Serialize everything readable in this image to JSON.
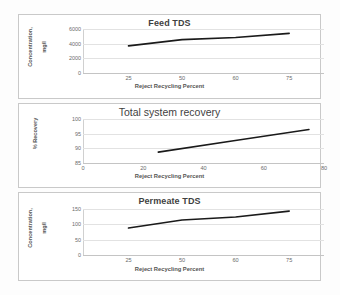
{
  "figure": {
    "background": "#fdfdfd",
    "panel_border_color": "#c9c9c9",
    "line_color": "#1a1a1a",
    "gridline_color": "#e2e2e2",
    "tick_text_color": "#6b6b6b",
    "title_text_color": "#3f3f3f"
  },
  "chart_data": [
    {
      "type": "line",
      "title": "Feed TDS",
      "xlabel": "Reject Recycling Percent",
      "ylabel": "Concentration,\nmg/l",
      "ylabel_line1": "Concentration,",
      "ylabel_line2": "mg/l",
      "x": [
        25,
        50,
        60,
        75
      ],
      "values": [
        3700,
        4550,
        4850,
        5400
      ],
      "xticks": [
        25,
        50,
        60,
        75
      ],
      "xtick_labels": [
        "25",
        "50",
        "60",
        "75"
      ],
      "yticks": [
        0,
        2000,
        4000,
        6000
      ],
      "ytick_labels": [
        "0",
        "2000",
        "4000",
        "6000"
      ],
      "ylim": [
        0,
        6000
      ],
      "xlim": [
        0,
        87.5
      ],
      "grid": true,
      "legend": "none",
      "series_name": "Feed TDS"
    },
    {
      "type": "line",
      "title": "Total system recovery",
      "xlabel": "Reject Recycling Percent",
      "ylabel": "% Recovery",
      "x": [
        25,
        50,
        60,
        75
      ],
      "values": [
        88.7,
        92.6,
        94.1,
        96.4
      ],
      "xticks": [
        0,
        20,
        40,
        60,
        80
      ],
      "xtick_labels": [
        "0",
        "20",
        "40",
        "60",
        "80"
      ],
      "yticks": [
        85,
        90,
        95,
        100
      ],
      "ytick_labels": [
        "85",
        "90",
        "95",
        "100"
      ],
      "ylim": [
        85,
        100
      ],
      "xlim": [
        0,
        80
      ],
      "grid": true,
      "legend": "none",
      "series_name": "Total system recovery"
    },
    {
      "type": "line",
      "title": "Permeate TDS",
      "xlabel": "Reject Recycling Percent",
      "ylabel": "Concentration,\nmg/l",
      "ylabel_line1": "Concentration,",
      "ylabel_line2": "mg/l",
      "x": [
        25,
        50,
        60,
        75
      ],
      "values": [
        88,
        114,
        124,
        143
      ],
      "xticks": [
        25,
        50,
        60,
        75
      ],
      "xtick_labels": [
        "25",
        "50",
        "60",
        "75"
      ],
      "yticks": [
        0,
        50,
        100,
        150
      ],
      "ytick_labels": [
        "0",
        "50",
        "100",
        "150"
      ],
      "ylim": [
        0,
        150
      ],
      "xlim": [
        0,
        87.5
      ],
      "grid": true,
      "legend": "none",
      "series_name": "Permeate TDS"
    }
  ]
}
